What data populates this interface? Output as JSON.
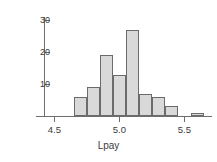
{
  "chart_data": {
    "type": "bar",
    "title": "",
    "subtitle": "",
    "xlabel": "Lpay",
    "ylabel": "",
    "grid": false,
    "legend": "none",
    "bin_width": 0.1,
    "categories": [
      "4.65-4.75",
      "4.75-4.85",
      "4.85-4.95",
      "4.95-5.05",
      "5.05-5.15",
      "5.15-5.25",
      "5.25-5.35",
      "5.35-5.45",
      "5.45-5.55",
      "5.55-5.65"
    ],
    "bin_edges": [
      4.65,
      4.75,
      4.85,
      4.95,
      5.05,
      5.15,
      5.25,
      5.35,
      5.45,
      5.55,
      5.65
    ],
    "values": [
      6,
      9,
      19,
      13,
      27,
      7,
      6,
      3,
      0,
      1
    ],
    "xlim": [
      4.42,
      5.72
    ],
    "ylim": [
      0,
      31
    ],
    "xticks": [
      4.5,
      5.0,
      5.5
    ],
    "xtick_labels": [
      "4.5",
      "5.0",
      "5.5"
    ],
    "yticks": [
      10,
      20,
      30
    ],
    "ytick_labels": [
      "10",
      "20",
      "30"
    ],
    "bar_fill_color": "#d9d9d9",
    "bar_edge_color": "#6b6b6b",
    "axis_color": "#6e6e6e",
    "background_color": "#ffffff"
  }
}
